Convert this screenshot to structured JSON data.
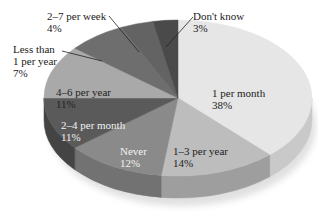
{
  "chart_data": {
    "type": "pie",
    "style": "3d",
    "title": "",
    "start_angle_deg": 0,
    "direction": "clockwise",
    "slices": [
      {
        "label": "1 per month",
        "value": 38,
        "pct_label": "38%",
        "color": "#e6e6e6",
        "side": "#c9c9c9"
      },
      {
        "label": "1–3 per year",
        "value": 14,
        "pct_label": "14%",
        "color": "#bdbdbd",
        "side": "#9e9e9e"
      },
      {
        "label": "Never",
        "value": 12,
        "pct_label": "12%",
        "color": "#8a8a8a",
        "side": "#727272"
      },
      {
        "label": "2–4 per month",
        "value": 11,
        "pct_label": "11%",
        "color": "#5a5a5a",
        "side": "#444444"
      },
      {
        "label": "4–6 per year",
        "value": 11,
        "pct_label": "11%",
        "color": "#a9a9a9",
        "side": "#8c8c8c"
      },
      {
        "label": "Less than 1 per year",
        "value": 7,
        "pct_label": "7%",
        "color": "#6e6e6e",
        "side": "#555555"
      },
      {
        "label": "2–7 per week",
        "value": 4,
        "pct_label": "4%",
        "color": "#636363",
        "side": "#4c4c4c"
      },
      {
        "label": "Don't know",
        "value": 3,
        "pct_label": "3%",
        "color": "#4a4a4a",
        "side": "#363636"
      }
    ]
  },
  "labels": {
    "one_per_month": {
      "line1": "1 per month",
      "line2": "38%"
    },
    "one_three_per_year": {
      "line1": "1–3 per year",
      "line2": "14%"
    },
    "never": {
      "line1": "Never",
      "line2": "12%"
    },
    "two_four_per_month": {
      "line1": "2–4 per month",
      "line2": "11%"
    },
    "four_six_per_year": {
      "line1": "4–6 per year",
      "line2": "11%"
    },
    "less_than_one_per_year": {
      "line1": "Less than",
      "line2": "1 per year",
      "line3": "7%"
    },
    "two_seven_per_week": {
      "line1": "2–7 per week",
      "line2": "4%"
    },
    "dont_know": {
      "line1": "Don't know",
      "line2": "3%"
    }
  }
}
